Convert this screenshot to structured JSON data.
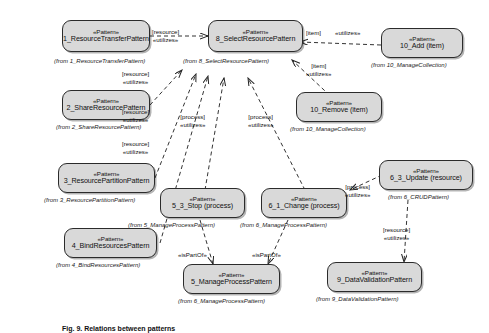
{
  "diagram": {
    "type": "uml-class-dependency-diagram",
    "stereotype": "«Pattern»",
    "caption": "Fig. 9. Relations between patterns",
    "nodes": [
      {
        "id": "n1",
        "stereotype": "«Pattern»",
        "name": "1_ResourceTransferPattern",
        "from": "(from  1_ResourceTransferPattern)"
      },
      {
        "id": "n2",
        "stereotype": "«Pattern»",
        "name": "2_ShareResourcePattern",
        "from": "(from  2_ShareResourcePattern)"
      },
      {
        "id": "n3",
        "stereotype": "«Pattern»",
        "name": "3_ResourcePartitionPattern",
        "from": "(from  3_ResourcePartitionPattern)"
      },
      {
        "id": "n4",
        "stereotype": "«Pattern»",
        "name": "4_BindResourcesPattern",
        "from": "(from  4_BindResourcesPattern)"
      },
      {
        "id": "n8",
        "stereotype": "«Pattern»",
        "name": "8_SelectResourcePattern",
        "from": "(from  8_SelectResourcePattern)"
      },
      {
        "id": "n10a",
        "stereotype": "«Pattern»",
        "name": "10_Add (item)",
        "from": "(from  10_ManageCollection)"
      },
      {
        "id": "n10r",
        "stereotype": "«Pattern»",
        "name": "10_Remove (item)",
        "from": "(from  10_ManageCollection)"
      },
      {
        "id": "n53",
        "stereotype": "«Pattern»",
        "name": "5_3_Stop (process)",
        "from": "(from  5_ManageProcessPattern)"
      },
      {
        "id": "n61",
        "stereotype": "«Pattern»",
        "name": "6_1_Change (process)",
        "from": "(from  6_ManageProcessPattern)"
      },
      {
        "id": "n63",
        "stereotype": "«Pattern»",
        "name": "6_3_Update (resource)",
        "from": "(from  6_CRUDPattern)"
      },
      {
        "id": "n5",
        "stereotype": "«Pattern»",
        "name": "5_ManageProcessPattern",
        "from": "(from  6_ManageProcessPattern)"
      },
      {
        "id": "n9",
        "stereotype": "«Pattern»",
        "name": "9_DataValidationPattern",
        "from": "(from  9_DataValidationPattern)"
      }
    ],
    "edge_labels": [
      {
        "id": "e1",
        "role": "[resource]",
        "stereotype": "«utilizes»"
      },
      {
        "id": "e2",
        "role": "[resource]",
        "stereotype": "«utilizes»"
      },
      {
        "id": "e3",
        "role": "[resource]",
        "stereotype": "«utilizes»"
      },
      {
        "id": "e4",
        "role": "[resource]",
        "stereotype": "«utilizes»"
      },
      {
        "id": "e5",
        "role": "[process]",
        "stereotype": "«utilizes»"
      },
      {
        "id": "e6",
        "role": "[process]",
        "stereotype": "«utilizes»"
      },
      {
        "id": "e7",
        "role": "[item]",
        "stereotype": "«utilizes»"
      },
      {
        "id": "e8",
        "role": "[item]",
        "stereotype": "«utilizes»"
      },
      {
        "id": "e9",
        "role": "[process]",
        "stereotype": "«utilizes»"
      },
      {
        "id": "e10",
        "role": "[resource]",
        "stereotype": "«utilizes»"
      },
      {
        "id": "e11",
        "role": "«isPartOf»",
        "stereotype": ""
      },
      {
        "id": "e12",
        "role": "«isPartOf»",
        "stereotype": ""
      }
    ]
  }
}
